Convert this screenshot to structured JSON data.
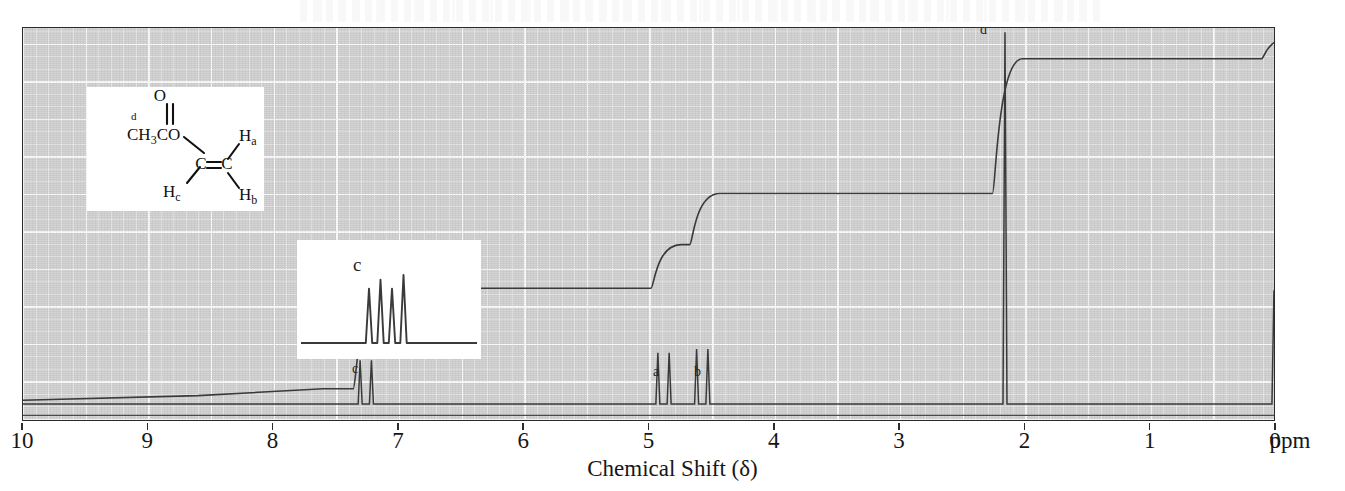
{
  "figure": {
    "x_axis_title": "Chemical Shift (δ)",
    "unit_label": "ppm"
  },
  "chart_data": {
    "type": "line",
    "title": "",
    "subtitle": "",
    "xlabel": "Chemical Shift (δ)",
    "ylabel": "",
    "xlim": [
      10,
      0
    ],
    "ylim": [
      0,
      1
    ],
    "x_unit": "ppm",
    "grid": true,
    "legend_position": "none",
    "axis_direction": "reversed",
    "tick_labels": [
      "10",
      "9",
      "8",
      "7",
      "6",
      "5",
      "4",
      "3",
      "2",
      "1",
      "0"
    ],
    "tick_values": [
      10,
      9,
      8,
      7,
      6,
      5,
      4,
      3,
      2,
      1,
      0
    ],
    "minor_tick_step": 0.1,
    "major_gridline_step": 0.5,
    "compound": "vinyl acetate",
    "series": [
      {
        "name": "spectrum",
        "role": "nmr-absorption-trace",
        "baseline_ppm_level": 0.03,
        "peaks": [
          {
            "label": "c",
            "shift": 7.26,
            "height": 0.115,
            "multiplicity": "dd",
            "assignment": "Hc (vinyl CH, O-CH=)",
            "protons": 1
          },
          {
            "label": "a",
            "shift": 4.88,
            "height": 0.135,
            "multiplicity": "dd",
            "assignment": "Ha",
            "protons": 1
          },
          {
            "label": "b",
            "shift": 4.57,
            "height": 0.145,
            "multiplicity": "dd",
            "assignment": "Hb",
            "protons": 1
          },
          {
            "label": "d",
            "shift": 2.15,
            "height": 0.98,
            "multiplicity": "s",
            "assignment": "CH3CO",
            "protons": 3
          },
          {
            "label": "TMS",
            "shift": 0.0,
            "height": 0.3,
            "multiplicity": "s",
            "assignment": "tetramethylsilane reference",
            "protons": 0
          }
        ]
      },
      {
        "name": "integration",
        "role": "integral-step-trace",
        "start_level": 0.04,
        "steps": [
          {
            "at_shift": 7.26,
            "rise": 0.265,
            "for_peak": "c"
          },
          {
            "at_shift": 4.88,
            "rise": 0.115,
            "for_peak": "a"
          },
          {
            "at_shift": 4.57,
            "rise": 0.135,
            "for_peak": "b"
          },
          {
            "at_shift": 2.15,
            "rise": 0.355,
            "for_peak": "d"
          },
          {
            "at_shift": 0.0,
            "rise": 0.055,
            "for_peak": "TMS"
          }
        ]
      }
    ],
    "peak_annotations": [
      {
        "text": "c",
        "shift": 7.35,
        "y_frac": 0.115
      },
      {
        "text": "a",
        "shift": 4.98,
        "y_frac": 0.135
      },
      {
        "text": "b",
        "shift": 4.65,
        "y_frac": 0.145
      },
      {
        "text": "d",
        "shift": 2.3,
        "y_frac": 0.95
      }
    ]
  },
  "structure_inset": {
    "name": "vinyl-acetate-structure",
    "atoms": [
      {
        "id": "methyl-carbonyl",
        "text": "CH",
        "sub": "3",
        "text2": "CO"
      },
      {
        "id": "carbonyl-oxygen",
        "text": "O"
      },
      {
        "id": "methyl-label",
        "text": "d"
      },
      {
        "id": "alkene-carbon-1",
        "text": "C"
      },
      {
        "id": "alkene-carbon-2",
        "text": "C"
      },
      {
        "id": "hydrogen-a",
        "text": "H",
        "sub": "a"
      },
      {
        "id": "hydrogen-b",
        "text": "H",
        "sub": "b"
      },
      {
        "id": "hydrogen-c",
        "text": "H",
        "sub": "c"
      }
    ]
  },
  "expansion_inset": {
    "name": "c-multiplet-expansion",
    "label": "c",
    "lines": 4,
    "relative_heights": [
      0.8,
      0.93,
      0.8,
      1.0
    ],
    "description": "expanded doublet of doublets for Hc"
  }
}
